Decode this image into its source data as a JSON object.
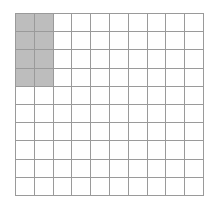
{
  "grid": {
    "rows": 10,
    "columns": 10,
    "total_cells": 100,
    "shaded_cells": 8,
    "shaded_region": {
      "row_start": 1,
      "row_end": 4,
      "col_start": 1,
      "col_end": 2
    },
    "colors": {
      "shaded": "#bdbdbd",
      "unshaded": "#ffffff",
      "line": "#9a9a9a"
    }
  }
}
